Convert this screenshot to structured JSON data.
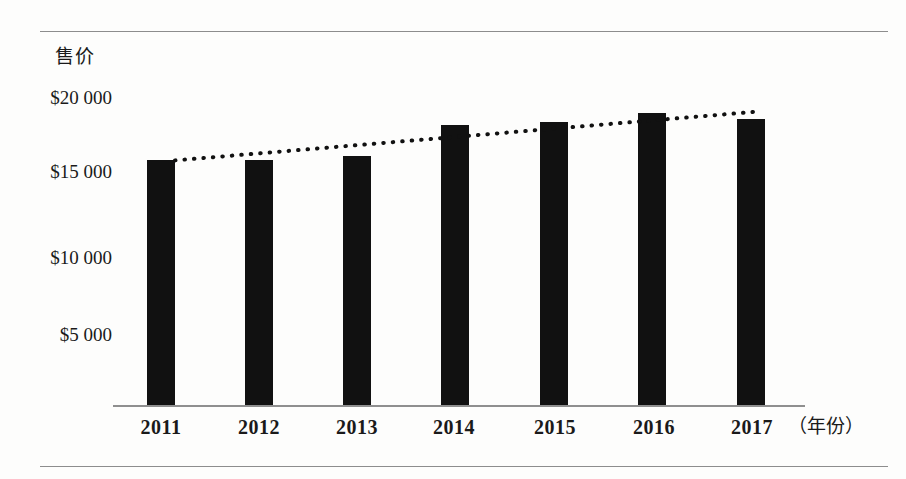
{
  "chart_data": {
    "type": "bar",
    "title": "",
    "ylabel": "售价",
    "xlabel": "（年份）",
    "categories": [
      "2011",
      "2012",
      "2013",
      "2014",
      "2015",
      "2016",
      "2017"
    ],
    "values": [
      15800,
      15800,
      16100,
      18200,
      18400,
      19000,
      18600
    ],
    "series": [
      {
        "name": "售价",
        "values": [
          15800,
          15800,
          16100,
          18200,
          18400,
          19000,
          18600
        ]
      },
      {
        "name": "趋势线",
        "type": "trendline",
        "style": "dotted",
        "values": [
          15800,
          16350,
          16900,
          17450,
          18000,
          18550,
          19100
        ]
      }
    ],
    "ytick_labels": [
      "$20 000",
      "$15 000",
      "$10 000",
      "$5 000"
    ],
    "ytick_values": [
      20000,
      15000,
      10000,
      5000
    ],
    "ylim": [
      0,
      21500
    ],
    "grid": false,
    "legend": "none",
    "bar_color": "#111111",
    "trendline_color": "#111111",
    "axis_color": "#8f8f8f"
  },
  "axes": {
    "y_title": "售价",
    "x_unit": "（年份）"
  },
  "colors": {
    "page_background": "#fdfdfc",
    "rule": "#8d8d8d",
    "bar": "#111111",
    "text": "#1a1a1a"
  }
}
